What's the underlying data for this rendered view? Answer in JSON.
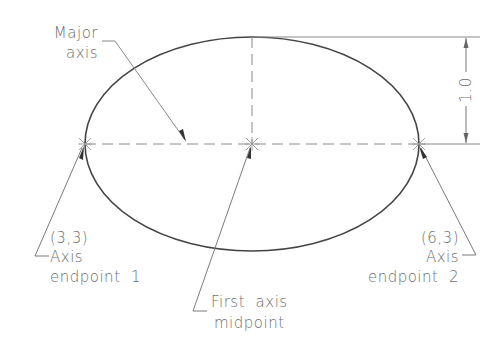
{
  "diagram": {
    "type": "ellipse-construction",
    "labels": {
      "major_axis_line1": "Major",
      "major_axis_line2": "axis",
      "endpoint1_coord": "(3,3)",
      "endpoint1_line1": "Axis",
      "endpoint1_line2": "endpoint  1",
      "endpoint2_coord": "(6,3)",
      "endpoint2_line1": "Axis",
      "endpoint2_line2": "endpoint  2",
      "midpoint_line1": "First  axis",
      "midpoint_line2": "midpoint",
      "dimension_value": "1.0"
    },
    "points": {
      "axis_endpoint_1": [
        3,
        3
      ],
      "axis_endpoint_2": [
        6,
        3
      ]
    },
    "colors": {
      "outline": "#444444",
      "dashed": "#8a8a8a",
      "text": "#6e6e6e",
      "leader": "#7a7a7a"
    }
  }
}
